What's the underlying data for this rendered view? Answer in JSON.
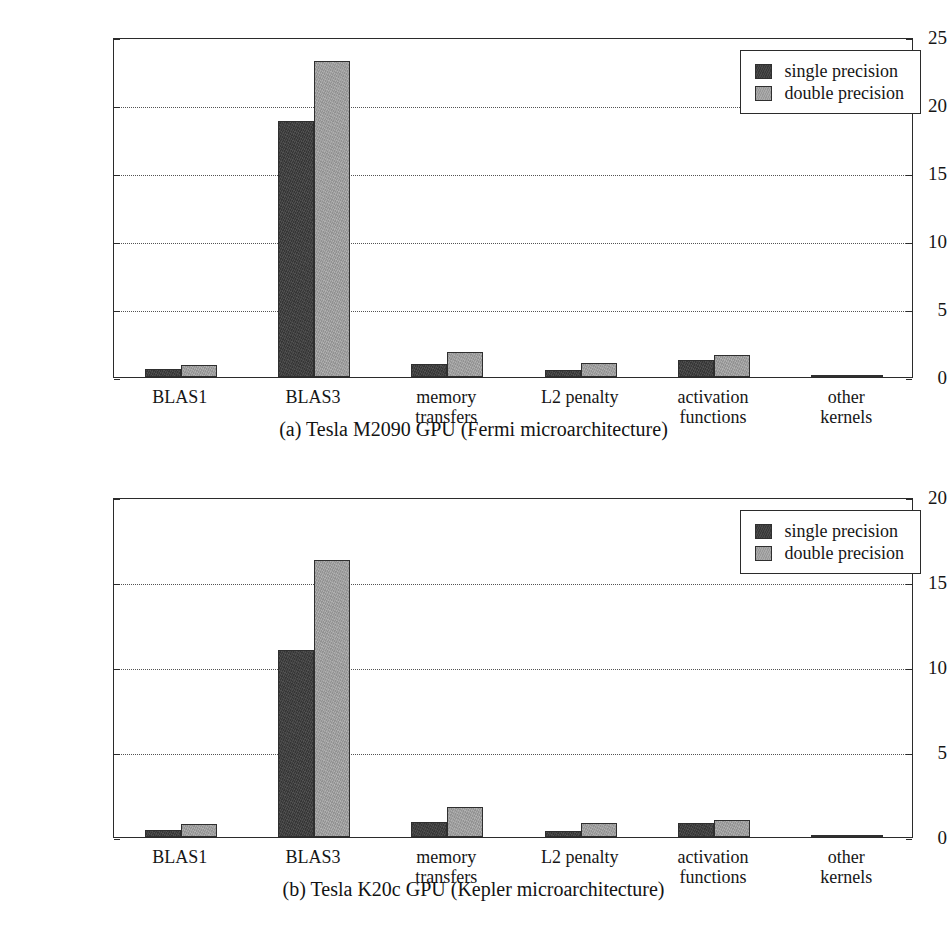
{
  "figure": {
    "subfigures": [
      {
        "id": "a",
        "caption": "(a) Tesla M2090 GPU (Fermi microarchitecture)",
        "chart_data": {
          "type": "bar",
          "title": "",
          "xlabel": "",
          "ylabel": "Execution time [s]",
          "ylim": [
            0,
            25
          ],
          "yticks": [
            0,
            5,
            10,
            15,
            20,
            25
          ],
          "ytick_labels": [
            "0",
            "5",
            "10",
            "15",
            "20",
            "25"
          ],
          "grid": true,
          "grid_axis": "y",
          "legend_position": "top-right",
          "categories": [
            "BLAS1",
            "BLAS3",
            "memory\ntransfers",
            "L2 penalty",
            "activation\nfunctions",
            "other\nkernels"
          ],
          "series": [
            {
              "name": "single precision",
              "color": "#3c3c3c",
              "values": [
                0.6,
                18.8,
                0.95,
                0.5,
                1.25,
                0.12
              ]
            },
            {
              "name": "double precision",
              "color": "#a2a2a2",
              "values": [
                0.9,
                23.2,
                1.85,
                1.0,
                1.6,
                0.18
              ]
            }
          ]
        }
      },
      {
        "id": "b",
        "caption": "(b) Tesla K20c GPU (Kepler microarchitecture)",
        "chart_data": {
          "type": "bar",
          "title": "",
          "xlabel": "",
          "ylabel": "Execution time [s]",
          "ylim": [
            0,
            20
          ],
          "yticks": [
            0,
            5,
            10,
            15,
            20
          ],
          "ytick_labels": [
            "0",
            "5",
            "10",
            "15",
            "20"
          ],
          "grid": true,
          "grid_axis": "y",
          "legend_position": "top-right",
          "categories": [
            "BLAS1",
            "BLAS3",
            "memory\ntransfers",
            "L2 penalty",
            "activation\nfunctions",
            "other\nkernels"
          ],
          "series": [
            {
              "name": "single precision",
              "color": "#3c3c3c",
              "values": [
                0.4,
                11.0,
                0.9,
                0.35,
                0.8,
                0.08
              ]
            },
            {
              "name": "double precision",
              "color": "#a2a2a2",
              "values": [
                0.75,
                16.3,
                1.75,
                0.8,
                1.0,
                0.12
              ]
            }
          ]
        }
      }
    ]
  }
}
